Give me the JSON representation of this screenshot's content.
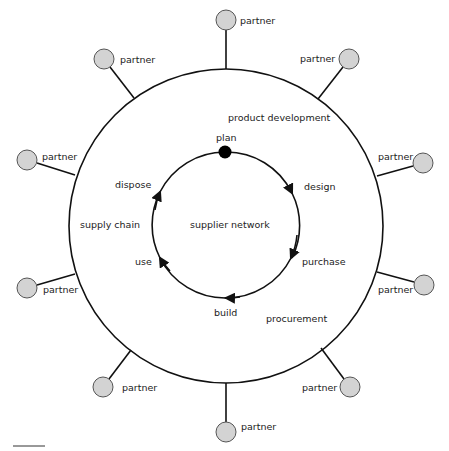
{
  "diagram": {
    "colors": {
      "stroke": "#111111",
      "partner_fill": "#d3d3d3",
      "partner_stroke": "#555555",
      "plan_dot": "#000000",
      "text": "#222222"
    },
    "outer_ring": {
      "cx": 226,
      "cy": 226,
      "r": 157,
      "labels": {
        "product_development": "product development",
        "supply_chain": "supply chain",
        "procurement": "procurement"
      }
    },
    "inner_cycle": {
      "cx": 225,
      "cy": 225,
      "r": 73,
      "center_label": "supplier network",
      "stages": {
        "plan": "plan",
        "design": "design",
        "purchase": "purchase",
        "build": "build",
        "use": "use",
        "dispose": "dispose"
      }
    },
    "partners": [
      {
        "label": "partner",
        "cx": 226,
        "cy": 20
      },
      {
        "label": "partner",
        "cx": 349,
        "cy": 59
      },
      {
        "label": "partner",
        "cx": 423,
        "cy": 163
      },
      {
        "label": "partner",
        "cx": 424,
        "cy": 285
      },
      {
        "label": "partner",
        "cx": 350,
        "cy": 387
      },
      {
        "label": "partner",
        "cx": 226,
        "cy": 432
      },
      {
        "label": "partner",
        "cx": 103,
        "cy": 387
      },
      {
        "label": "partner",
        "cx": 27,
        "cy": 288
      },
      {
        "label": "partner",
        "cx": 27,
        "cy": 160
      },
      {
        "label": "partner",
        "cx": 104,
        "cy": 59
      }
    ]
  }
}
